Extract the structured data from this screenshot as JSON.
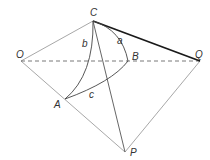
{
  "diagram": {
    "type": "spherical-triangle-geometry",
    "colors": {
      "gray_line": "#a8a8a8",
      "dark_line": "#333333",
      "thick_line": "#1a1a1a",
      "label": "#333333"
    },
    "points": {
      "O": {
        "label": "O",
        "x": 21,
        "y": 61
      },
      "C": {
        "label": "C",
        "x": 93,
        "y": 21
      },
      "B": {
        "label": "B",
        "x": 128,
        "y": 61
      },
      "Q": {
        "label": "Q",
        "x": 200,
        "y": 61
      },
      "A": {
        "label": "A",
        "x": 65,
        "y": 99
      },
      "P": {
        "label": "P",
        "x": 125,
        "y": 152
      }
    },
    "arc_labels": {
      "a": "a",
      "b": "b",
      "c": "c"
    }
  }
}
